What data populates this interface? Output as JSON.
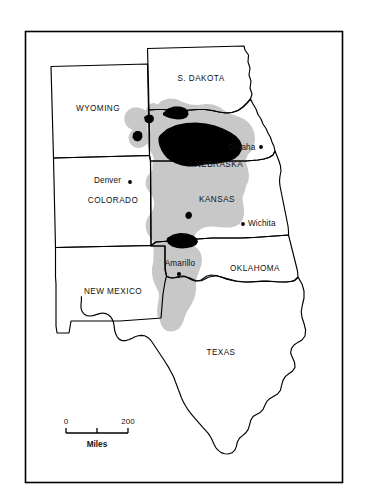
{
  "figure": {
    "type": "thematic-map",
    "background_color": "#ffffff",
    "frame": {
      "outer_border_color": "#000000",
      "inner_border_color": "#000000"
    }
  },
  "legend_colors": {
    "aquifer_light": "#c8c8c8",
    "aquifer_dark": "#000000",
    "state_outline": "#000000",
    "label_text": "#111111"
  },
  "states": [
    {
      "id": "wyoming",
      "label": "WYOMING",
      "label_x": 98,
      "label_y": 111
    },
    {
      "id": "s-dakota",
      "label": "S. DAKOTA",
      "label_x": 201,
      "label_y": 81
    },
    {
      "id": "nebraska",
      "label": "NEBRASKA",
      "label_x": 219,
      "label_y": 167
    },
    {
      "id": "colorado",
      "label": "COLORADO",
      "label_x": 113,
      "label_y": 203
    },
    {
      "id": "kansas",
      "label": "KANSAS",
      "label_x": 217,
      "label_y": 202
    },
    {
      "id": "oklahoma",
      "label": "OKLAHOMA",
      "label_x": 255,
      "label_y": 271
    },
    {
      "id": "new-mexico",
      "label": "NEW MEXICO",
      "label_x": 113,
      "label_y": 294
    },
    {
      "id": "texas",
      "label": "TEXAS",
      "label_x": 221,
      "label_y": 355
    }
  ],
  "cities": [
    {
      "id": "omaha",
      "label": "Omaha",
      "label_x": 228,
      "label_y": 150,
      "anchor": "start",
      "dot_x": 261,
      "dot_y": 147
    },
    {
      "id": "denver",
      "label": "Denver",
      "label_x": 94,
      "label_y": 183,
      "anchor": "start",
      "dot_x": 130,
      "dot_y": 182
    },
    {
      "id": "wichita",
      "label": "Wichita",
      "label_x": 248,
      "label_y": 226,
      "anchor": "start",
      "dot_x": 243,
      "dot_y": 224
    },
    {
      "id": "amarillo",
      "label": "Amarillo",
      "label_x": 163,
      "label_y": 266,
      "anchor": "middle",
      "dot_x": 179,
      "dot_y": 274
    }
  ],
  "scale_bar": {
    "start_label": "0",
    "end_label": "200",
    "unit_label": "Miles",
    "start_x": 66,
    "end_x": 128,
    "bar_y": 428,
    "tick_count": 3
  }
}
